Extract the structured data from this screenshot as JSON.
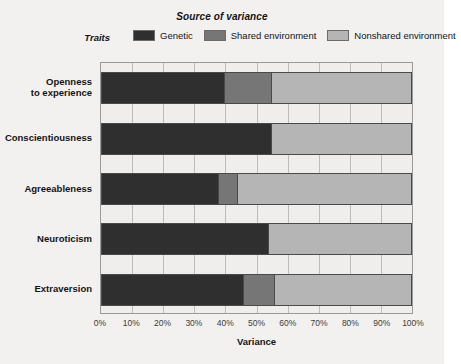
{
  "chart_data": {
    "type": "bar",
    "orientation": "horizontal",
    "stacked": true,
    "title": "Source of variance",
    "xlabel": "Variance",
    "ylabel": "Traits",
    "xlim": [
      0,
      100
    ],
    "xtick_labels": [
      "0%",
      "10%",
      "20%",
      "30%",
      "40%",
      "50%",
      "60%",
      "70%",
      "80%",
      "90%",
      "100%"
    ],
    "grid": true,
    "legend_position": "top",
    "categories": [
      "Openness\nto experience",
      "Conscientiousness",
      "Agreeableness",
      "Neuroticism",
      "Extraversion"
    ],
    "series": [
      {
        "name": "Genetic",
        "color": "#2f2f2f",
        "values": [
          40,
          55,
          38,
          54,
          46
        ]
      },
      {
        "name": "Shared environment",
        "color": "#767676",
        "values": [
          15,
          0,
          6,
          0,
          10
        ]
      },
      {
        "name": "Nonshared environment",
        "color": "#b5b5b5",
        "values": [
          45,
          45,
          56,
          46,
          44
        ]
      }
    ]
  },
  "traits": [
    {
      "line1": "Openness",
      "line2": "to experience"
    },
    {
      "line1": "Conscientiousness",
      "line2": ""
    },
    {
      "line1": "Agreeableness",
      "line2": ""
    },
    {
      "line1": "Neuroticism",
      "line2": ""
    },
    {
      "line1": "Extraversion",
      "line2": ""
    }
  ],
  "legend": [
    {
      "label": "Genetic",
      "color": "#2f2f2f"
    },
    {
      "label": "Shared environment",
      "color": "#767676"
    },
    {
      "label": "Nonshared environment",
      "color": "#b5b5b5"
    }
  ],
  "colors": {
    "figure_background": "#f2f1ef",
    "plot_background": "#efeeec",
    "gridline": "#bdbcba",
    "frame_border": "#9a9a9a",
    "text": "#141414"
  }
}
